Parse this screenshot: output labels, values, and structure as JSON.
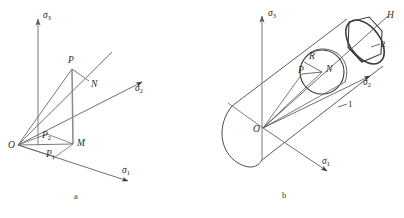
{
  "figure": {
    "title": "",
    "panels": [
      {
        "id": "a",
        "caption": "a",
        "description": "Principal stress space with stress point P, its deviatoric projection N and plane projections",
        "axes": [
          {
            "name": "sigma-3-axis",
            "label": "σ",
            "sub": "3"
          },
          {
            "name": "sigma-2-axis",
            "label": "σ",
            "sub": "2"
          },
          {
            "name": "sigma-1-axis",
            "label": "σ",
            "sub": "1"
          }
        ],
        "points": [
          {
            "name": "origin",
            "label": "O"
          },
          {
            "name": "stress-point-p",
            "label": "P"
          },
          {
            "name": "deviatoric-point-n",
            "label": "N"
          },
          {
            "name": "projection-point-m",
            "label": "M"
          },
          {
            "name": "projection-point-p1",
            "label": "P",
            "sub": "1"
          },
          {
            "name": "projection-point-p2",
            "label": "P",
            "sub": "2"
          }
        ]
      },
      {
        "id": "b",
        "caption": "b",
        "description": "Mises cylinder and Tresca hexagonal prism about hydrostatic axis",
        "axes": [
          {
            "name": "sigma-3-axis",
            "label": "σ",
            "sub": "3"
          },
          {
            "name": "sigma-2-axis",
            "label": "σ",
            "sub": "2"
          },
          {
            "name": "sigma-1-axis",
            "label": "σ",
            "sub": "1"
          }
        ],
        "points": [
          {
            "name": "origin",
            "label": "O"
          },
          {
            "name": "stress-point-p",
            "label": "P"
          },
          {
            "name": "deviatoric-point-n",
            "label": "N"
          },
          {
            "name": "radius-label-r",
            "label": "R"
          },
          {
            "name": "hydrostatic-axis-h",
            "label": "H"
          }
        ],
        "callouts": [
          {
            "name": "callout-1",
            "label": "1"
          },
          {
            "name": "callout-2",
            "label": "2"
          }
        ]
      }
    ]
  },
  "colors": {
    "stroke": "#3b3b3b",
    "stroke_light": "#6e6e6e",
    "background": "#ffffff",
    "text": "#2b2b2b"
  }
}
